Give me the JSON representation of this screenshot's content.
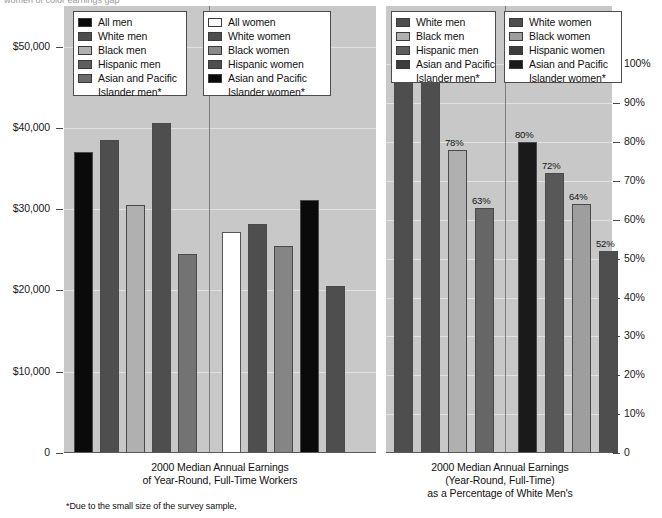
{
  "top_cut_text": "women of color                                  earnings gap",
  "chart_data": [
    {
      "id": "earnings",
      "type": "bar",
      "title": "2000 Median Annual Earnings of Year-Round, Full-Time Workers",
      "caption_lines": [
        "2000 Median Annual Earnings",
        "of Year-Round, Full-Time Workers"
      ],
      "xlabel": "",
      "ylabel": "",
      "ylim": [
        0,
        55000
      ],
      "grid": true,
      "legend_position": "top",
      "yticks": [
        {
          "value": 50000,
          "label": "$50,000"
        },
        {
          "value": 40000,
          "label": "$40,000"
        },
        {
          "value": 30000,
          "label": "$30,000"
        },
        {
          "value": 20000,
          "label": "$20,000"
        },
        {
          "value": 10000,
          "label": "$10,000"
        },
        {
          "value": 0,
          "label": "0"
        }
      ],
      "groups": [
        {
          "name": "men",
          "legend_title": "",
          "series": [
            {
              "name": "All men",
              "value": 37000,
              "color": "#0a0a0a"
            },
            {
              "name": "White men",
              "value": 38500,
              "color": "#4e4e4e"
            },
            {
              "name": "Black men",
              "value": 30500,
              "color": "#b0b0b0"
            },
            {
              "name": "Hispanic men",
              "value": 40600,
              "color": "#4e4e4e"
            },
            {
              "name": "Asian and Pacific Islander men*",
              "value": 24500,
              "color": "#737373"
            }
          ]
        },
        {
          "name": "women",
          "legend_title": "",
          "series": [
            {
              "name": "All women",
              "value": 27200,
              "color": "#ffffff"
            },
            {
              "name": "White women",
              "value": 28200,
              "color": "#4e4e4e"
            },
            {
              "name": "Black women",
              "value": 25500,
              "color": "#858585"
            },
            {
              "name": "Hispanic women",
              "value": 31100,
              "color": "#0a0a0a"
            },
            {
              "name": "Asian and Pacific Islander women*",
              "value": 20500,
              "color": "#4e4e4e"
            }
          ]
        }
      ]
    },
    {
      "id": "percentage",
      "type": "bar",
      "title": "2000 Median Annual Earnings (Year-Round, Full-Time) as a Percentage of White Men's",
      "caption_lines": [
        "2000 Median Annual Earnings",
        "(Year-Round, Full-Time)",
        "as a Percentage of White Men's"
      ],
      "xlabel": "",
      "ylabel": "",
      "ylim": [
        0,
        115
      ],
      "grid": true,
      "legend_position": "top",
      "yticks": [
        {
          "value": 100,
          "label": "100%"
        },
        {
          "value": 90,
          "label": "90%"
        },
        {
          "value": 80,
          "label": "80%"
        },
        {
          "value": 70,
          "label": "70%"
        },
        {
          "value": 60,
          "label": "60%"
        },
        {
          "value": 50,
          "label": "50%"
        },
        {
          "value": 40,
          "label": "40%"
        },
        {
          "value": 30,
          "label": "30%"
        },
        {
          "value": 20,
          "label": "20%"
        },
        {
          "value": 10,
          "label": "10%"
        },
        {
          "value": 0,
          "label": "0"
        }
      ],
      "groups": [
        {
          "name": "men",
          "series": [
            {
              "name": "White men",
              "value": 100,
              "label": "100%",
              "color": "#4e4e4e"
            },
            {
              "name": "Black men",
              "value": 105,
              "label": "105%",
              "color": "#4e4e4e"
            },
            {
              "name": "Hispanic men",
              "value": 78,
              "label": "78%",
              "color": "#b0b0b0"
            },
            {
              "name": "Asian and Pacific Islander men*",
              "value": 63,
              "label": "63%",
              "color": "#666666"
            }
          ]
        },
        {
          "name": "women",
          "series": [
            {
              "name": "White women",
              "value": 80,
              "label": "80%",
              "color": "#1a1a1a"
            },
            {
              "name": "Black women",
              "value": 72,
              "label": "72%",
              "color": "#585858"
            },
            {
              "name": "Hispanic women",
              "value": 64,
              "label": "64%",
              "color": "#9e9e9e"
            },
            {
              "name": "Asian and Pacific Islander women*",
              "value": 52,
              "label": "52%",
              "color": "#4e4e4e"
            }
          ]
        }
      ]
    }
  ],
  "legends": {
    "left_men": {
      "items": [
        {
          "label": "All men",
          "color": "#0a0a0a"
        },
        {
          "label": "White men",
          "color": "#4e4e4e"
        },
        {
          "label": "Black men",
          "color": "#b0b0b0"
        },
        {
          "label": "Hispanic men",
          "color": "#5e5e5e"
        },
        {
          "label": "Asian and Pacific",
          "color": "#6b6b6b",
          "cont": "Islander men*"
        }
      ]
    },
    "left_women": {
      "items": [
        {
          "label": "All women",
          "color": "#ffffff"
        },
        {
          "label": "White women",
          "color": "#4e4e4e"
        },
        {
          "label": "Black women",
          "color": "#8a8a8a"
        },
        {
          "label": "Hispanic women",
          "color": "#4e4e4e"
        },
        {
          "label": "Asian and Pacific",
          "color": "#0a0a0a",
          "cont": "Islander women*"
        }
      ]
    },
    "right_men": {
      "items": [
        {
          "label": "White men",
          "color": "#4e4e4e"
        },
        {
          "label": "Black men",
          "color": "#b0b0b0"
        },
        {
          "label": "Hispanic men",
          "color": "#5e5e5e"
        },
        {
          "label": "Asian and Pacific",
          "color": "#3c3c3c",
          "cont": "Islander men*"
        }
      ]
    },
    "right_women": {
      "items": [
        {
          "label": "White women",
          "color": "#4e4e4e"
        },
        {
          "label": "Black women",
          "color": "#9e9e9e"
        },
        {
          "label": "Hispanic women",
          "color": "#3c3c3c",
          "cont": null
        },
        {
          "label": "Asian and Pacific",
          "color": "#1a1a1a",
          "cont": "Islander women*"
        }
      ]
    }
  },
  "footnote": "*Due to the small size of the survey sample,"
}
